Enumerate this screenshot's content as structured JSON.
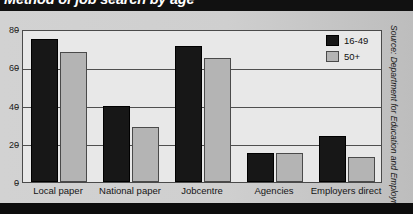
{
  "title": "Method of job search by age",
  "source": "Source: Department for Education and Employment",
  "legend": {
    "items": [
      {
        "label": "16-49",
        "color": "#171717"
      },
      {
        "label": "50+",
        "color": "#b4b4b4"
      }
    ]
  },
  "chart_data": {
    "type": "bar",
    "title": "Method of job search by age",
    "xlabel": "",
    "ylabel": "",
    "ylim": [
      0,
      80
    ],
    "yticks": [
      0,
      20,
      40,
      60,
      80
    ],
    "grid": true,
    "legend_position": "top-right",
    "categories": [
      "Local paper",
      "National paper",
      "Jobcentre",
      "Agencies",
      "Employers direct"
    ],
    "series": [
      {
        "name": "16-49",
        "color": "#171717",
        "values": [
          75,
          40,
          71,
          15,
          24
        ]
      },
      {
        "name": "50+",
        "color": "#b4b4b4",
        "values": [
          68,
          29,
          65,
          15,
          13
        ]
      }
    ],
    "annotations": [
      "Source: Department for Education and Employment"
    ]
  }
}
